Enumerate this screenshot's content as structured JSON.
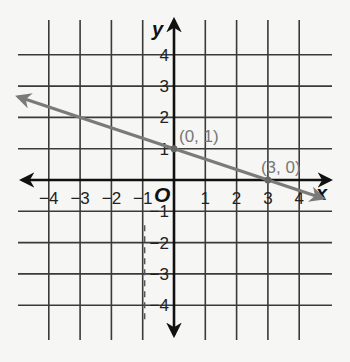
{
  "chart_data": {
    "type": "line",
    "title": "",
    "xlabel": "x",
    "ylabel": "y",
    "origin_label": "O",
    "xlim": [
      -4.5,
      4.5
    ],
    "ylim": [
      -4.5,
      4.5
    ],
    "grid": true,
    "x_ticks": [
      -4,
      -3,
      -2,
      -1,
      1,
      2,
      3,
      4
    ],
    "y_ticks": [
      -4,
      -3,
      -2,
      -1,
      1,
      2,
      3,
      4
    ],
    "x_tick_labels": [
      "−4",
      "−3",
      "−2",
      "−1",
      "1",
      "2",
      "3",
      "4"
    ],
    "y_tick_labels": [
      "−4",
      "−3",
      "−2",
      "−1",
      "1",
      "2",
      "3",
      "4"
    ],
    "series": [
      {
        "name": "line",
        "equation": "y = -1/3 x + 1",
        "slope": -0.3333,
        "intercept": 1,
        "color": "#7a7a7a",
        "arrows_both_ends": true,
        "x": [
          -4.98,
          4.75
        ],
        "y": [
          2.66,
          -0.58
        ]
      }
    ],
    "points": [
      {
        "x": 0,
        "y": 1,
        "label": "(0, 1)"
      },
      {
        "x": 3,
        "y": 0,
        "label": "(3, 0)"
      }
    ],
    "annotations": [
      {
        "type": "dashed-vertical-line",
        "x": -1,
        "y_range": [
          -4.5,
          0
        ]
      }
    ]
  }
}
